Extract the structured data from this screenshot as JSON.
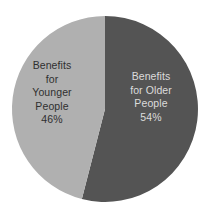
{
  "chart_data": {
    "type": "pie",
    "title": "",
    "subtitle": "",
    "xlabel": "",
    "ylabel": "",
    "legend": "none",
    "grid": false,
    "labels_inside_slices": true,
    "start_angle_deg": 0,
    "direction": "clockwise",
    "categories": [
      "Benefits for Older People",
      "Benefits for Younger People"
    ],
    "values": [
      54,
      46
    ],
    "unit": "%",
    "slices": [
      {
        "name": "Benefits for Older People",
        "value": 54,
        "value_label": "54%",
        "color": "#545454",
        "text_color": "#dcdcdc",
        "label_lines": [
          "Benefits",
          "for Older",
          "People",
          "54%"
        ],
        "start_angle_deg": 0,
        "sweep_angle_deg": 194.4
      },
      {
        "name": "Benefits for Younger People",
        "value": 46,
        "value_label": "46%",
        "color": "#b0b0b0",
        "text_color": "#2f2f2f",
        "label_lines": [
          "Benefits",
          "for",
          "Younger",
          "People",
          "46%"
        ],
        "start_angle_deg": 194.4,
        "sweep_angle_deg": 165.6
      }
    ]
  },
  "pie": {
    "center_x": 105,
    "center_y": 109,
    "radius": 93,
    "background_color": "#ffffff"
  },
  "labels": {
    "younger": {
      "line1": "Benefits",
      "line2": "for",
      "line3": "Younger",
      "line4": "People",
      "line5": "46%"
    },
    "older": {
      "line1": "Benefits",
      "line2": "for Older",
      "line3": "People",
      "line4": "54%"
    }
  }
}
